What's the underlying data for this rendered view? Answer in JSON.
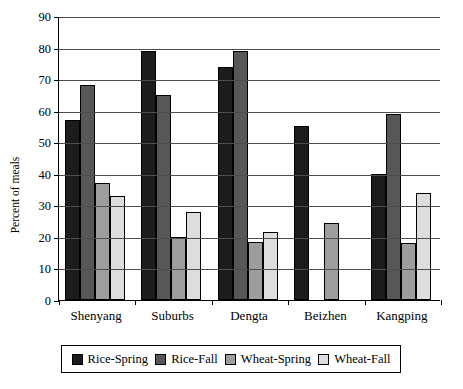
{
  "chart_data": {
    "type": "bar",
    "title": "",
    "xlabel": "",
    "ylabel": "Percent of meals",
    "ylim": [
      0,
      90
    ],
    "ytick_step": 10,
    "yticks": [
      0,
      10,
      20,
      30,
      40,
      50,
      60,
      70,
      80,
      90
    ],
    "grid": true,
    "legend_position": "bottom",
    "categories": [
      "Shenyang",
      "Suburbs",
      "Dengta",
      "Beizhen",
      "Kangping"
    ],
    "series": [
      {
        "name": "Rice-Spring",
        "color": "#1c1c1c",
        "values": [
          57,
          79,
          74,
          55,
          40
        ]
      },
      {
        "name": "Rice-Fall",
        "color": "#575757",
        "values": [
          68,
          65,
          79,
          null,
          59
        ]
      },
      {
        "name": "Wheat-Spring",
        "color": "#9d9d9d",
        "values": [
          37,
          20,
          18.5,
          24.5,
          18
        ]
      },
      {
        "name": "Wheat-Fall",
        "color": "#dddddd",
        "values": [
          33,
          28,
          21.5,
          null,
          34
        ]
      }
    ]
  },
  "legend": {
    "items": [
      {
        "label": "Rice-Spring",
        "color": "#1c1c1c"
      },
      {
        "label": "Rice-Fall",
        "color": "#575757"
      },
      {
        "label": "Wheat-Spring",
        "color": "#9d9d9d"
      },
      {
        "label": "Wheat-Fall",
        "color": "#dddddd"
      }
    ]
  },
  "axis": {
    "y_title": "Percent of meals",
    "y_tick_labels": [
      "0",
      "10",
      "20",
      "30",
      "40",
      "50",
      "60",
      "70",
      "80",
      "90"
    ],
    "x_tick_labels": [
      "Shenyang",
      "Suburbs",
      "Dengta",
      "Beizhen",
      "Kangping"
    ]
  }
}
